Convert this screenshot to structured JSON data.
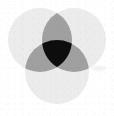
{
  "figure": {
    "background_color": "#ffffff",
    "width": 114,
    "height": 116
  },
  "chart_data": {
    "type": "venn",
    "subtitle": "",
    "xlabel": "",
    "ylabel": "",
    "set_count": 3,
    "grid": false,
    "legend": "none",
    "sets": [
      {
        "name": "A",
        "label": "",
        "position": "top-left",
        "center_x": 40,
        "center_y": 40,
        "radius": 32,
        "fill": "#ececec"
      },
      {
        "name": "B",
        "label": "",
        "position": "top-right",
        "center_x": 74,
        "center_y": 40,
        "radius": 32,
        "fill": "#ececec"
      },
      {
        "name": "C",
        "label": "",
        "position": "bottom-center",
        "center_x": 57,
        "center_y": 72,
        "radius": 32,
        "fill": "#ececec"
      }
    ],
    "regions": [
      {
        "id": "A-only",
        "sets": [
          "A"
        ],
        "shade": "light",
        "fill": "#ececec"
      },
      {
        "id": "B-only",
        "sets": [
          "B"
        ],
        "shade": "light",
        "fill": "#ececec"
      },
      {
        "id": "C-only",
        "sets": [
          "C"
        ],
        "shade": "light",
        "fill": "#ececec"
      },
      {
        "id": "A-and-B",
        "sets": [
          "A",
          "B"
        ],
        "shade": "medium",
        "fill": "#a0a0a0"
      },
      {
        "id": "A-and-C",
        "sets": [
          "A",
          "C"
        ],
        "shade": "medium",
        "fill": "#a0a0a0"
      },
      {
        "id": "B-and-C",
        "sets": [
          "B",
          "C"
        ],
        "shade": "medium",
        "fill": "#a0a0a0"
      },
      {
        "id": "A-and-B-and-C",
        "sets": [
          "A",
          "B",
          "C"
        ],
        "shade": "dark",
        "fill": "#0d0d0d"
      }
    ],
    "palette": {
      "background": "#ffffff",
      "single": "#ececec",
      "pairwise": "#a0a0a0",
      "triple": "#0d0d0d"
    }
  }
}
